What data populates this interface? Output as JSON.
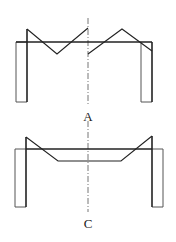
{
  "figures": [
    {
      "id": "A",
      "label": "A",
      "description": "Frame with zigzag top chord (truss-like), symmetric about dash-dot centerline"
    },
    {
      "id": "C",
      "label": "C",
      "description": "Frame with trapezoidal lower chord below top beam, symmetric about dash-dot centerline"
    }
  ],
  "colors": {
    "stroke": "#222222",
    "thin_stroke": "#555555",
    "centerline": "#777777",
    "background": "#ffffff"
  }
}
